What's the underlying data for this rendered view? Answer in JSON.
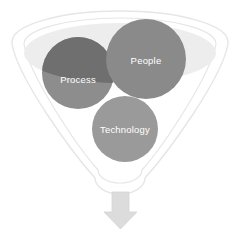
{
  "diagram": {
    "type": "funnel-venn",
    "title": "",
    "background_color": "#ffffff",
    "funnel": {
      "name": "funnel-shape",
      "rim_fill": "#ffffff",
      "rim_stroke": "#e3e3e3",
      "inner_fill": "#ededed",
      "inner_stroke": "#e0e0e0",
      "body_fill": "#ffffff"
    },
    "circles": [
      {
        "id": "process",
        "label": "Process",
        "color": "#8d8d8d",
        "color_overlap": "#6f6f6f",
        "label_color": "#ffffff",
        "cx": 78,
        "cy": 73,
        "r": 36
      },
      {
        "id": "people",
        "label": "People",
        "color": "#8a8a8a",
        "label_color": "#ffffff",
        "cx": 146,
        "cy": 59,
        "r": 40
      },
      {
        "id": "technology",
        "label": "Technology",
        "color": "#9a9a9a",
        "label_color": "#ffffff",
        "cx": 125,
        "cy": 129,
        "r": 33
      }
    ],
    "arrow": {
      "name": "down-arrow",
      "direction": "down",
      "color": "#dcdcdc",
      "stroke": "#d0d0d0"
    }
  }
}
